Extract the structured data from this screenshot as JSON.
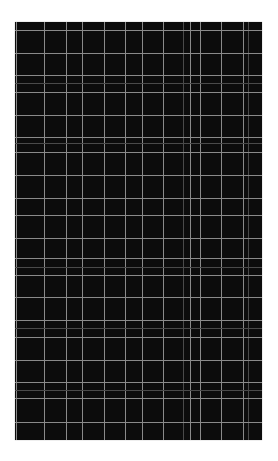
{
  "image": {
    "description": "Dark plaid grid pattern",
    "panel": {
      "left": 15,
      "top": 22,
      "width": 247,
      "height": 418,
      "background": "#0c0c0c"
    },
    "line_color": "#8a8a8a",
    "faint_line_color": "#4a4a4a",
    "vertical_lines": [
      {
        "x": 1,
        "faint": false
      },
      {
        "x": 29,
        "faint": false
      },
      {
        "x": 51,
        "faint": false
      },
      {
        "x": 67,
        "faint": false
      },
      {
        "x": 89,
        "faint": false
      },
      {
        "x": 110,
        "faint": false
      },
      {
        "x": 127,
        "faint": false
      },
      {
        "x": 148,
        "faint": false
      },
      {
        "x": 168,
        "faint": true
      },
      {
        "x": 175,
        "faint": false
      },
      {
        "x": 185,
        "faint": false
      },
      {
        "x": 206,
        "faint": false
      },
      {
        "x": 228,
        "faint": false
      },
      {
        "x": 233,
        "faint": true
      }
    ],
    "horizontal_lines": [
      {
        "y": 8,
        "faint": false
      },
      {
        "y": 31,
        "faint": false
      },
      {
        "y": 53,
        "faint": false
      },
      {
        "y": 61,
        "faint": true
      },
      {
        "y": 70,
        "faint": false
      },
      {
        "y": 93,
        "faint": false
      },
      {
        "y": 115,
        "faint": false
      },
      {
        "y": 121,
        "faint": true
      },
      {
        "y": 130,
        "faint": false
      },
      {
        "y": 153,
        "faint": false
      },
      {
        "y": 176,
        "faint": false
      },
      {
        "y": 193,
        "faint": false
      },
      {
        "y": 216,
        "faint": false
      },
      {
        "y": 236,
        "faint": false
      },
      {
        "y": 245,
        "faint": true
      },
      {
        "y": 253,
        "faint": false
      },
      {
        "y": 275,
        "faint": false
      },
      {
        "y": 298,
        "faint": false
      },
      {
        "y": 306,
        "faint": true
      },
      {
        "y": 315,
        "faint": false
      },
      {
        "y": 338,
        "faint": false
      },
      {
        "y": 360,
        "faint": false
      },
      {
        "y": 368,
        "faint": true
      },
      {
        "y": 376,
        "faint": false
      },
      {
        "y": 400,
        "faint": false
      }
    ]
  }
}
